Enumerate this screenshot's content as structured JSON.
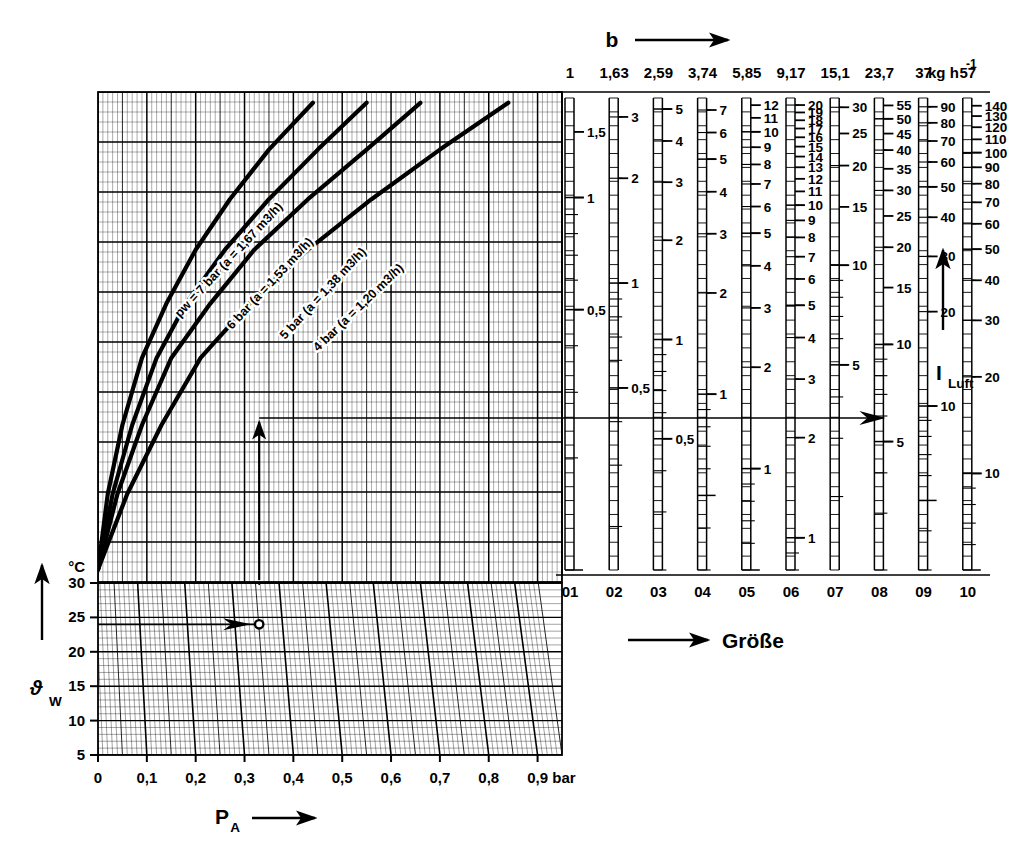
{
  "figure": {
    "kind": "nomogram",
    "language": "de",
    "background": "#ffffff",
    "ink": "#000000"
  },
  "top_axis": {
    "symbol": "b",
    "arrow": "right-arrow-icon",
    "unit": "kg h",
    "unit_exponent": "-1",
    "tick_labels": [
      "1",
      "1,63",
      "2,59",
      "3,74",
      "5,85",
      "9,17",
      "15,1",
      "23,7",
      "37",
      "57"
    ]
  },
  "left_chart": {
    "x_axis": {
      "name": "P",
      "subscript": "A",
      "arrow": "right-arrow-icon",
      "unit": "bar",
      "ticks": [
        "0",
        "0,1",
        "0,2",
        "0,3",
        "0,4",
        "0,5",
        "0,6",
        "0,7",
        "0,8",
        "0,9"
      ],
      "min": 0,
      "max": 0.95
    },
    "y_axis": {
      "name": "ϑ",
      "subscript": "W",
      "arrow": "up-arrow-icon",
      "unit": "°C",
      "ticks": [
        "30",
        "25",
        "20",
        "15",
        "10",
        "5"
      ],
      "tick_values": [
        30,
        25,
        20,
        15,
        10,
        5
      ]
    },
    "curves": [
      {
        "id": "curve-7bar",
        "label": "pw = 7 bar (a = 1,67 m3/h)",
        "pressure_bar": 7,
        "a_m3_h": 1.67
      },
      {
        "id": "curve-6bar",
        "label": "6 bar (a = 1,53 m3/h)",
        "pressure_bar": 6,
        "a_m3_h": 1.53
      },
      {
        "id": "curve-5bar",
        "label": "5 bar (a = 1,38 m3/h)",
        "pressure_bar": 5,
        "a_m3_h": 1.38
      },
      {
        "id": "curve-4bar",
        "label": "4 bar (a = 1,20 m3/h)",
        "pressure_bar": 4,
        "a_m3_h": 1.2
      }
    ],
    "worked_example": {
      "p_a_bar": 0.33,
      "water_temperature_c": 24,
      "selected_curve": "curve-4bar",
      "description": "vertical arrow up from P_A = 0,33 bar to the 4 bar curve, then horizontal right into the size scales"
    }
  },
  "size_chart": {
    "axis_label": "Größe",
    "arrow": "right-arrow-icon",
    "right_axis_label": "I",
    "right_axis_subscript": "Luft",
    "right_axis_arrow": "up-arrow-icon",
    "column_labels": [
      "01",
      "02",
      "03",
      "04",
      "05",
      "06",
      "07",
      "08",
      "09",
      "10"
    ],
    "columns": [
      {
        "id": "01",
        "top_value": "1",
        "labels": [
          "1,5",
          "1",
          "0,5"
        ],
        "label_values": [
          1.5,
          1.0,
          0.5
        ],
        "scale_max": 1.85,
        "scale_min": 0.1
      },
      {
        "id": "02",
        "top_value": "1,63",
        "labels": [
          "3",
          "2",
          "1",
          "0,5"
        ],
        "label_values": [
          3,
          2,
          1,
          0.5
        ],
        "scale_max": 3.4,
        "scale_min": 0.15
      },
      {
        "id": "03",
        "top_value": "2,59",
        "labels": [
          "5",
          "4",
          "3",
          "2",
          "1",
          "0,5"
        ],
        "label_values": [
          5,
          4,
          3,
          2,
          1,
          0.5
        ],
        "scale_max": 5.4,
        "scale_min": 0.2
      },
      {
        "id": "04",
        "top_value": "3,74",
        "labels": [
          "7",
          "6",
          "5",
          "4",
          "3",
          "2",
          "1"
        ],
        "label_values": [
          7,
          6,
          5,
          4,
          3,
          2,
          1
        ],
        "scale_max": 7.6,
        "scale_min": 0.3
      },
      {
        "id": "05",
        "top_value": "5,85",
        "labels": [
          "12",
          "11",
          "10",
          "9",
          "8",
          "7",
          "6",
          "5",
          "4",
          "3",
          "2",
          "1"
        ],
        "label_values": [
          12,
          11,
          10,
          9,
          8,
          7,
          6,
          5,
          4,
          3,
          2,
          1
        ],
        "scale_max": 12.6,
        "scale_min": 0.5
      },
      {
        "id": "06",
        "top_value": "9,17",
        "labels": [
          "20",
          "19",
          "18",
          "17",
          "16",
          "15",
          "14",
          "13",
          "12",
          "11",
          "10",
          "9",
          "8",
          "7",
          "6",
          "5",
          "4",
          "3",
          "2",
          "1"
        ],
        "label_values": [
          20,
          19,
          18,
          17,
          16,
          15,
          14,
          13,
          12,
          11,
          10,
          9,
          8,
          7,
          6,
          5,
          4,
          3,
          2,
          1
        ],
        "scale_max": 21,
        "scale_min": 0.8
      },
      {
        "id": "07",
        "top_value": "15,1",
        "labels": [
          "30",
          "25",
          "20",
          "15",
          "10",
          "5"
        ],
        "label_values": [
          30,
          25,
          20,
          15,
          10,
          5
        ],
        "scale_max": 32,
        "scale_min": 1.2
      },
      {
        "id": "08",
        "top_value": "23,7",
        "labels": [
          "55",
          "50",
          "45",
          "40",
          "35",
          "30",
          "25",
          "20",
          "15",
          "10",
          "5"
        ],
        "label_values": [
          55,
          50,
          45,
          40,
          35,
          30,
          25,
          20,
          15,
          10,
          5
        ],
        "scale_max": 58,
        "scale_min": 2
      },
      {
        "id": "09",
        "top_value": "37",
        "labels": [
          "90",
          "80",
          "70",
          "60",
          "50",
          "40",
          "30",
          "20",
          "10"
        ],
        "label_values": [
          90,
          80,
          70,
          60,
          50,
          40,
          30,
          20,
          10
        ],
        "scale_max": 96,
        "scale_min": 3
      },
      {
        "id": "10",
        "top_value": "57",
        "labels": [
          "140",
          "130",
          "120",
          "110",
          "100",
          "90",
          "80",
          "70",
          "60",
          "50",
          "40",
          "30",
          "20",
          "10"
        ],
        "label_values": [
          140,
          130,
          120,
          110,
          100,
          90,
          80,
          70,
          60,
          50,
          40,
          30,
          20,
          10
        ],
        "scale_max": 148,
        "scale_min": 5
      }
    ],
    "readout": {
      "column": "08",
      "value": "20",
      "marker": "right-arrow-marker"
    }
  },
  "chart_data": {
    "type": "line",
    "title": "",
    "xlabel": "P_A (bar)",
    "ylabel": "b (kg h^-1) / Größe",
    "xlim": [
      0,
      0.95
    ],
    "ylim_kg_h": [
      1,
      57
    ],
    "grid": true,
    "legend": "inline curve labels",
    "series": [
      {
        "name": "pw = 7 bar (a = 1,67 m3/h)",
        "x": [
          0.0,
          0.02,
          0.05,
          0.09,
          0.14,
          0.2,
          0.27,
          0.35,
          0.44
        ],
        "y": [
          1.0,
          1.9,
          3.4,
          6.0,
          9.5,
          15.0,
          23.0,
          35.0,
          52.0
        ]
      },
      {
        "name": "6 bar (a = 1,53 m3/h)",
        "x": [
          0.0,
          0.03,
          0.07,
          0.12,
          0.18,
          0.26,
          0.35,
          0.45,
          0.55
        ],
        "y": [
          1.0,
          1.9,
          3.4,
          6.0,
          9.5,
          15.0,
          23.0,
          35.0,
          52.0
        ]
      },
      {
        "name": "5 bar (a = 1,38 m3/h)",
        "x": [
          0.0,
          0.04,
          0.09,
          0.15,
          0.23,
          0.32,
          0.43,
          0.55,
          0.66
        ],
        "y": [
          1.0,
          1.9,
          3.4,
          6.0,
          9.5,
          15.0,
          23.0,
          35.0,
          52.0
        ]
      },
      {
        "name": "4 bar (a = 1,20 m3/h)",
        "x": [
          0.0,
          0.06,
          0.13,
          0.21,
          0.31,
          0.43,
          0.56,
          0.7,
          0.84
        ],
        "y": [
          1.0,
          1.9,
          3.4,
          6.0,
          9.5,
          15.0,
          23.0,
          35.0,
          52.0
        ]
      }
    ],
    "lower_panel": {
      "type": "line",
      "ylabel": "ϑ_W (°C)",
      "yticks": [
        30,
        25,
        20,
        15,
        10,
        5
      ],
      "xticks": [
        0,
        0.1,
        0.2,
        0.3,
        0.4,
        0.5,
        0.6,
        0.7,
        0.8,
        0.9
      ],
      "marker_point": {
        "x": 0.33,
        "y": 24
      }
    }
  }
}
